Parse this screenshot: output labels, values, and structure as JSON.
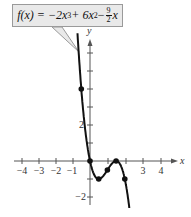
{
  "chart_data": {
    "type": "line",
    "function": "-2x^3 + 6x^2 - 4.5x",
    "xlabel": "x",
    "ylabel": "y",
    "xlim": [
      -4.3,
      4.6
    ],
    "ylim": [
      -2.5,
      7
    ],
    "x_tick_labels": [
      "-4",
      "-3",
      "-2",
      "-1",
      "3",
      "4"
    ],
    "y_tick_labels": [
      "2",
      "-2"
    ],
    "points": [
      {
        "x": -0.5,
        "y": 4
      },
      {
        "x": 0,
        "y": 0
      },
      {
        "x": 0.5,
        "y": -1
      },
      {
        "x": 1,
        "y": -0.5
      },
      {
        "x": 1.5,
        "y": 0
      },
      {
        "x": 2,
        "y": -1
      }
    ],
    "grid": false
  },
  "label": {
    "lhs": "f(x) = −2x",
    "exp3": "3",
    "mid": " + 6x",
    "exp2": "2",
    "minus": " − ",
    "num": "9",
    "den": "2",
    "tail": "x"
  },
  "axes": {
    "x": "x",
    "y": "y"
  },
  "ticks": {
    "xm4": "−4",
    "xm3": "−3",
    "xm2": "−2",
    "xm1": "−1",
    "x3": "3",
    "x4": "4",
    "y2": "2",
    "ym2": "−2"
  }
}
